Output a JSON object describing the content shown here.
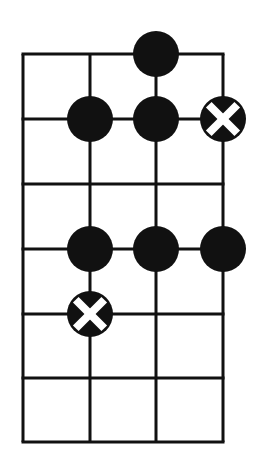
{
  "diagram": {
    "type": "fretboard-grid",
    "strings_x": [
      23,
      90,
      156,
      223
    ],
    "frets_y": [
      54,
      119,
      184,
      249,
      314,
      378,
      442
    ],
    "line_color": "#111111",
    "dot_color": "#111111",
    "x_mark_color": "#ffffff",
    "dot_radius": 23,
    "markers": [
      {
        "string": 2,
        "fret": 0,
        "kind": "filled"
      },
      {
        "string": 1,
        "fret": 1,
        "kind": "filled"
      },
      {
        "string": 2,
        "fret": 1,
        "kind": "filled"
      },
      {
        "string": 3,
        "fret": 1,
        "kind": "x"
      },
      {
        "string": 1,
        "fret": 3,
        "kind": "filled"
      },
      {
        "string": 2,
        "fret": 3,
        "kind": "filled"
      },
      {
        "string": 3,
        "fret": 3,
        "kind": "filled"
      },
      {
        "string": 1,
        "fret": 4,
        "kind": "x"
      }
    ]
  }
}
